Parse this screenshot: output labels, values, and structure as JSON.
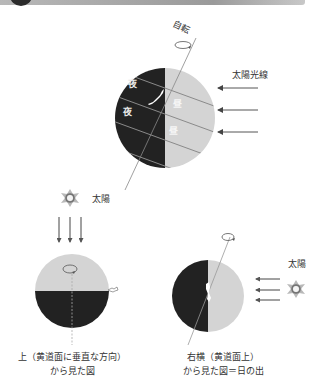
{
  "header": {
    "bar_color": "#a0a0a0",
    "badge_color": "#2b2b2b"
  },
  "main_globe": {
    "rotation_label": "自転",
    "sunlight_label": "太陽光線",
    "night_labels": [
      "夜",
      "夜"
    ],
    "day_labels": [
      "昼",
      "昼"
    ],
    "night_color": "#222222",
    "day_color": "#d4d4d4",
    "sunlight_arrow_count": 3
  },
  "top_view": {
    "sun_label": "太陽",
    "arrow_count": 3,
    "caption_line1": "上（黄道面に垂直な方向）",
    "caption_line2": "から見た図"
  },
  "side_view": {
    "sun_label": "太陽",
    "arrow_count": 3,
    "caption_line1": "右横（黄道面上）",
    "caption_line2": "から見た図＝日の出"
  }
}
